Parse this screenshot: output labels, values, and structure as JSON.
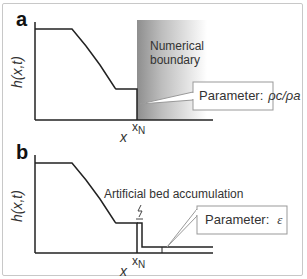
{
  "panels": [
    {
      "label": "a",
      "ylabel": "h(x,t)",
      "xlabel": "x",
      "xmark": "x",
      "xmark_sub": "N",
      "region_label_line1": "Numerical",
      "region_label_line2": "boundary",
      "callout_prefix": "Parameter:",
      "callout_value": "ρc/ρa"
    },
    {
      "label": "b",
      "ylabel": "h(x,t)",
      "xlabel": "x",
      "xmark": "x",
      "xmark_sub": "N",
      "annotation": "Artificial bed accumulation",
      "callout_prefix": "Parameter:",
      "callout_value": "ε"
    }
  ],
  "colors": {
    "line": "#222222",
    "frame": "#c8c8c8",
    "boundary_gradient_start": "#9a9a9a",
    "boundary_gradient_end": "#ffffff"
  }
}
